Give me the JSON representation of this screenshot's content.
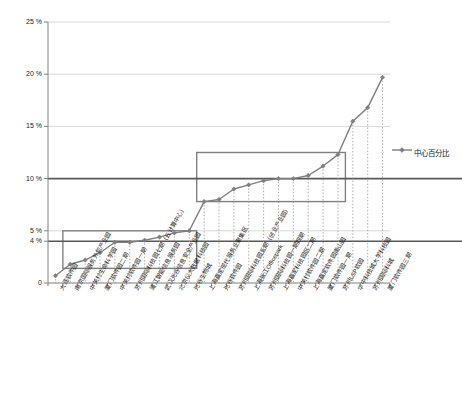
{
  "chart_data": {
    "type": "line",
    "title": "",
    "xlabel": "",
    "ylabel": "",
    "ylim": [
      0,
      25
    ],
    "grid": true,
    "legend_position": "right",
    "y_ticks": [
      "0",
      "4 %",
      "5 %",
      "10 %",
      "15 %",
      "20 %",
      "25 %"
    ],
    "y_tick_values": [
      0,
      4,
      5,
      10,
      15,
      20,
      25
    ],
    "series": [
      {
        "name": "中心百分比",
        "values": [
          0.7,
          1.8,
          2.2,
          2.9,
          3.9,
          3.9,
          4.1,
          4.4,
          4.8,
          5.0,
          7.8,
          8.0,
          9.0,
          9.4,
          9.8,
          10.0,
          10.0,
          10.3,
          11.2,
          12.3,
          15.5,
          16.8,
          19.7
        ]
      }
    ],
    "categories": [
      "大连软件园",
      "南京国际服务外包产业园",
      "中关村生命科学园",
      "厦门软件园二期",
      "中关村软件园一期",
      "苏州国际科技园七期（云计算中心）",
      "浦江智能信息服务园",
      "武汉光谷信息安全产业园",
      "北京仪大数据科技园",
      "光谷生物城",
      "上海嘉定现代服务业聚集区",
      "光谷软件园",
      "苏州国际科技园五期（创业产业园）",
      "上海张江Officepark",
      "苏州国际科技园一期四期",
      "上海嘉定科技园区二期",
      "中关村软件园二期",
      "上海嘉定软件园南山园",
      "厦门软件园一期",
      "苏州LSP软园",
      "华中科技城大学科技园",
      "苏州国际科城",
      "厦门软件园三期"
    ],
    "reference_lines": [
      {
        "name": "lower-reference-line",
        "value": 4
      },
      {
        "name": "upper-reference-line",
        "value": 10
      }
    ],
    "highlight_boxes": [
      {
        "name": "lower-cluster-box",
        "y_low": 1.4,
        "y_high": 5.0,
        "x_start_index": 1,
        "x_end_index": 9
      },
      {
        "name": "upper-cluster-box",
        "y_low": 7.8,
        "y_high": 12.5,
        "x_start_index": 10,
        "x_end_index": 19
      }
    ],
    "legend": [
      {
        "label": "中心百分比",
        "color": "#7f7f7f",
        "marker": "diamond"
      }
    ],
    "colors": {
      "series_line": "#7f7f7f",
      "grid": "#d9d9d9",
      "reference_line": "#595959",
      "box_border": "#808080",
      "axis": "#808080",
      "text": "#1a1a1a"
    }
  }
}
